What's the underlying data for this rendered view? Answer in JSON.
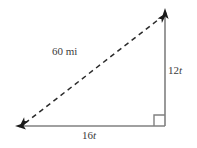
{
  "figure": {
    "type": "right-triangle-diagram",
    "background_color": "#ffffff",
    "width": 197,
    "height": 148,
    "labels": {
      "hypotenuse": {
        "text": "60 mi",
        "number": "60",
        "unit": "mi",
        "color": "#3b3b3b"
      },
      "vertical_leg": {
        "text": "12t",
        "coefficient": "12",
        "variable": "t",
        "color": "#3b3b3b"
      },
      "horizontal_leg": {
        "text": "16t",
        "coefficient": "16",
        "variable": "t",
        "color": "#3b3b3b"
      }
    },
    "geometry": {
      "vertex_bottom_left": [
        22,
        126
      ],
      "vertex_bottom_right": [
        165,
        126
      ],
      "vertex_top_right": [
        165,
        14
      ],
      "hypotenuse_style": "dashed",
      "leg_style": "solid",
      "line_color": "#808080",
      "arrow_color": "#1a1a1a",
      "right_angle_marker": true,
      "right_angle_marker_size": 11,
      "arrows": {
        "hypotenuse_start": "arrow-left-down",
        "hypotenuse_end": "arrow-right-up",
        "vertical_top": "arrow-up",
        "horizontal_left": "arrow-left"
      }
    }
  }
}
